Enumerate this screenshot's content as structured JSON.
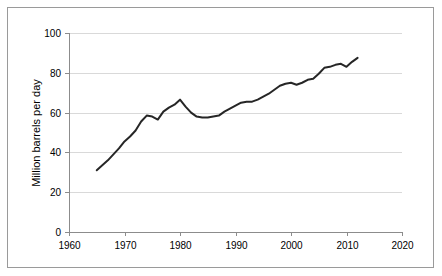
{
  "chart_data": {
    "type": "line",
    "title": "",
    "xlabel": "",
    "ylabel": "Million barrels per day",
    "xlim": [
      1960,
      2020
    ],
    "ylim": [
      0,
      100
    ],
    "xticks": [
      1960,
      1970,
      1980,
      1990,
      2000,
      2010,
      2020
    ],
    "xtick_labels": [
      "1960",
      "1970",
      "1980",
      "1990",
      "2000",
      "2010",
      "2020"
    ],
    "yticks": [
      0,
      20,
      40,
      60,
      80,
      100
    ],
    "ytick_labels": [
      "0",
      "20",
      "40",
      "60",
      "80",
      "100"
    ],
    "grid": "horizontal",
    "legend": "none",
    "line_color": "#262626",
    "grid_color": "#d9d9d9",
    "axis_color": "#8c8c8c",
    "series": [
      {
        "name": "World oil production",
        "x": [
          1965,
          1966,
          1967,
          1968,
          1969,
          1970,
          1971,
          1972,
          1973,
          1974,
          1975,
          1976,
          1977,
          1978,
          1979,
          1980,
          1981,
          1982,
          1983,
          1984,
          1985,
          1986,
          1987,
          1988,
          1989,
          1990,
          1991,
          1992,
          1993,
          1994,
          1995,
          1996,
          1997,
          1998,
          1999,
          2000,
          2001,
          2002,
          2003,
          2004,
          2005,
          2006,
          2007,
          2008,
          2009,
          2010,
          2011,
          2012
        ],
        "values": [
          31.0,
          33.5,
          36.0,
          39.0,
          42.0,
          45.5,
          48.0,
          51.0,
          55.5,
          58.5,
          58.0,
          56.5,
          60.5,
          62.5,
          64.0,
          66.5,
          63.0,
          60.0,
          58.0,
          57.5,
          57.5,
          58.0,
          58.5,
          60.5,
          62.0,
          63.5,
          65.0,
          65.5,
          65.5,
          66.5,
          68.0,
          69.5,
          71.5,
          73.5,
          74.5,
          75.0,
          74.0,
          75.0,
          76.5,
          77.0,
          79.5,
          82.5,
          83.0,
          84.0,
          84.5,
          83.0,
          85.5,
          87.5
        ]
      }
    ]
  },
  "axes": {
    "y_title": "Million barrels per day"
  }
}
